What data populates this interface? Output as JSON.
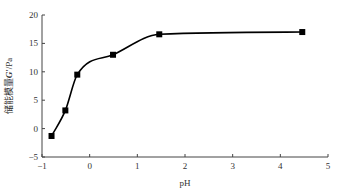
{
  "chart_data": {
    "type": "line",
    "title": "",
    "xlabel": "pH",
    "ylabel": "储能模量G′/Pa",
    "xlim": [
      -1,
      5
    ],
    "ylim": [
      -5,
      20
    ],
    "xticks": [
      -1,
      0,
      1,
      2,
      3,
      4,
      5
    ],
    "yticks": [
      -5,
      0,
      5,
      10,
      15,
      20
    ],
    "grid": false,
    "legend": null,
    "series": [
      {
        "name": "G′",
        "marker": "square",
        "line": "smooth",
        "color": "#000000",
        "x": [
          -0.8,
          -0.51,
          -0.26,
          0.49,
          1.46,
          4.46
        ],
        "y": [
          -1.3,
          3.2,
          9.5,
          13.0,
          16.6,
          17.0
        ]
      }
    ]
  },
  "axes": {
    "x_title": "pH",
    "y_title_prefix": "储能模量",
    "y_title_var": "G′",
    "y_title_suffix": "/Pa"
  }
}
